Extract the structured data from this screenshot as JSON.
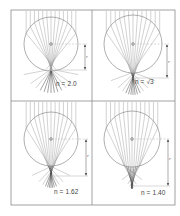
{
  "figure": {
    "frame": {
      "x": 11,
      "y": 10,
      "width": 164,
      "height": 195,
      "divider_x": 92,
      "divider_y": 101,
      "color": "#8a8a8a"
    },
    "colors": {
      "ray": "#9a9a9a",
      "ray_dark": "#333333",
      "circle": "#8c8c8c",
      "dim": "#555555",
      "dash": "#b0b0b0"
    },
    "dimension_symbol": "r",
    "panels": [
      {
        "id": "top-left",
        "label": "n = 2.0",
        "n": 2.0,
        "cx": 51,
        "cy": 44,
        "radius": 27,
        "focus_y": 70,
        "label_x": 56,
        "label_y": 85,
        "dim_x": 85
      },
      {
        "id": "top-right",
        "label": "n = √3",
        "n": 1.732,
        "cx": 133,
        "cy": 44,
        "radius": 29,
        "focus_y": 78,
        "label_x": 136,
        "label_y": 83,
        "dim_x": 167
      },
      {
        "id": "bottom-left",
        "label": "n = 1.62",
        "n": 1.62,
        "cx": 51,
        "cy": 139,
        "radius": 27,
        "focus_y": 176,
        "label_x": 55,
        "label_y": 193,
        "dim_x": 86
      },
      {
        "id": "bottom-right",
        "label": "n = 1.40",
        "n": 1.4,
        "cx": 132,
        "cy": 139,
        "radius": 28,
        "focus_y": 186,
        "label_x": 142,
        "label_y": 194,
        "dim_x": 168
      }
    ]
  }
}
